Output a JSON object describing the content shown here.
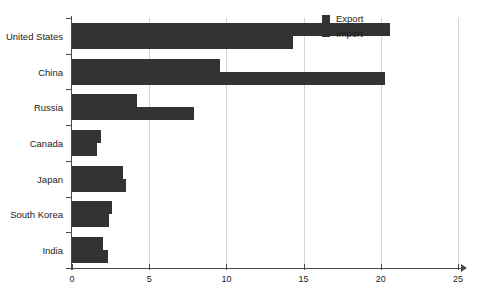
{
  "chart_data": {
    "type": "bar",
    "orientation": "horizontal",
    "title": "",
    "subtitle": "",
    "xlabel": "",
    "ylabel": "",
    "xlim": [
      0,
      25
    ],
    "ylim": null,
    "grid": true,
    "grid_axis": "x",
    "legend_position": "top-right",
    "categories": [
      "United States",
      "China",
      "Russia",
      "Canada",
      "Japan",
      "South Korea",
      "India"
    ],
    "xticks": [
      0,
      5,
      10,
      15,
      20,
      25
    ],
    "xtick_labels": [
      "0",
      "5",
      "10",
      "15",
      "20",
      "25"
    ],
    "series": [
      {
        "name": "Export",
        "color": "#333333",
        "values": [
          20.6,
          9.6,
          4.2,
          1.9,
          3.3,
          2.6,
          2.0
        ]
      },
      {
        "name": "Import",
        "color": "#333333",
        "values": [
          14.3,
          20.3,
          7.9,
          1.6,
          3.5,
          2.4,
          2.3
        ]
      }
    ]
  },
  "legend": {
    "items": [
      {
        "label": "Export",
        "color": "#333333"
      },
      {
        "label": "Import",
        "color": "#333333"
      }
    ]
  },
  "colors": {
    "bar": "#333333",
    "axis": "#4a4a4a",
    "grid": "#d4d4d4",
    "text": "#1c1c1c",
    "background": "#ffffff"
  }
}
